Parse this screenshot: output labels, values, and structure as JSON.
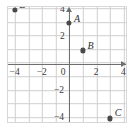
{
  "chart_data": {
    "type": "scatter",
    "title": "",
    "xlabel": "",
    "ylabel": "",
    "xlim": [
      -5,
      5
    ],
    "ylim": [
      -5,
      5
    ],
    "grid": true,
    "legend": "none",
    "x_ticks": [
      {
        "value": -4,
        "label": "−4"
      },
      {
        "value": -2,
        "label": "−2"
      },
      {
        "value": 0,
        "label": "0"
      },
      {
        "value": 2,
        "label": "2"
      },
      {
        "value": 4,
        "label": "4"
      }
    ],
    "y_ticks": [
      {
        "value": 4,
        "label": "4"
      },
      {
        "value": 2,
        "label": "2"
      },
      {
        "value": -2,
        "label": "−2"
      },
      {
        "value": -4,
        "label": "−4"
      }
    ],
    "points": [
      {
        "label": "A",
        "x": 0,
        "y": 3,
        "label_dx": 5,
        "label_dy": -9
      },
      {
        "label": "B",
        "x": 1,
        "y": 1,
        "label_dx": 5,
        "label_dy": -9
      },
      {
        "label": "C",
        "x": 3,
        "y": -4,
        "label_dx": 5,
        "label_dy": -10
      },
      {
        "label": "D",
        "x": -4,
        "y": 4,
        "label_dx": 5,
        "label_dy": -10
      }
    ],
    "point_color": "#4a4a4a",
    "axis_color": "#6e6e6e",
    "grid_color": "#cfcfcf"
  }
}
